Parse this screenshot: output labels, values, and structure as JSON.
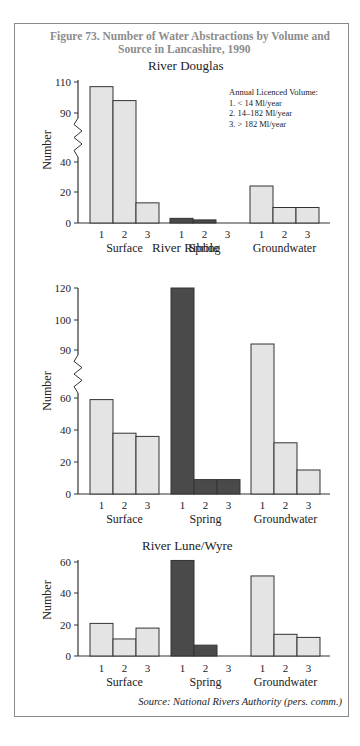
{
  "figure": {
    "title_line1": "Figure 73.  Number of Water Abstractions by Volume and",
    "title_line2": "Source in Lancashire, 1990",
    "source": "Source: National Rivers Authority (pers. comm.)"
  },
  "legend": {
    "heading": "Annual Licenced Volume:",
    "items": [
      "1.  < 14 Ml/year",
      "2.  14–182 Ml/year",
      "3.  > 182 Ml/year"
    ]
  },
  "colors": {
    "light_bar": "#e4e4e4",
    "dark_bar": "#4a4a4a",
    "outline": "#333333",
    "title_gray": "#8c8c8c"
  },
  "chart_data": [
    {
      "type": "bar",
      "title": "River Douglas",
      "xlabel": "",
      "ylabel": "Number",
      "groups": [
        "Surface",
        "Spring",
        "Groundwater"
      ],
      "categories": [
        "1",
        "2",
        "3"
      ],
      "series": [
        {
          "name": "Surface",
          "values": [
            107,
            98,
            13
          ]
        },
        {
          "name": "Spring",
          "values": [
            3,
            2,
            0
          ]
        },
        {
          "name": "Groundwater",
          "values": [
            24,
            10,
            10
          ]
        }
      ],
      "yticks": [
        0,
        20,
        40,
        90,
        110
      ],
      "axis_break": [
        40,
        90
      ],
      "ylim": [
        0,
        110
      ]
    },
    {
      "type": "bar",
      "title": "River Ribble",
      "xlabel": "",
      "ylabel": "Number",
      "groups": [
        "Surface",
        "Spring",
        "Groundwater"
      ],
      "categories": [
        "1",
        "2",
        "3"
      ],
      "series": [
        {
          "name": "Surface",
          "values": [
            59,
            38,
            36
          ]
        },
        {
          "name": "Spring",
          "values": [
            120,
            9,
            9
          ]
        },
        {
          "name": "Groundwater",
          "values": [
            92,
            32,
            15
          ]
        }
      ],
      "yticks": [
        0,
        20,
        40,
        60,
        90,
        100,
        120
      ],
      "axis_break": [
        60,
        90
      ],
      "ylim": [
        0,
        120
      ]
    },
    {
      "type": "bar",
      "title": "River Lune/Wyre",
      "xlabel": "",
      "ylabel": "Number",
      "groups": [
        "Surface",
        "Spring",
        "Groundwater"
      ],
      "categories": [
        "1",
        "2",
        "3"
      ],
      "series": [
        {
          "name": "Surface",
          "values": [
            21,
            11,
            18
          ]
        },
        {
          "name": "Spring",
          "values": [
            61,
            7,
            0
          ]
        },
        {
          "name": "Groundwater",
          "values": [
            51,
            14,
            12
          ]
        }
      ],
      "yticks": [
        0,
        20,
        40,
        60
      ],
      "ylim": [
        0,
        65
      ]
    }
  ]
}
